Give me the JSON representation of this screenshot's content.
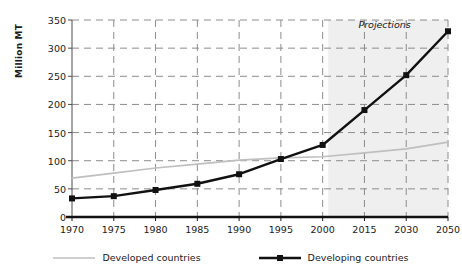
{
  "chart_data": {
    "type": "line",
    "title": "",
    "xlabel": "",
    "ylabel": "Million MT",
    "categories": [
      "1970",
      "1975",
      "1980",
      "1985",
      "1990",
      "1995",
      "2000",
      "2015",
      "2030",
      "2050"
    ],
    "ylim": [
      0,
      350
    ],
    "yticks": [
      0,
      50,
      100,
      150,
      200,
      250,
      300,
      350
    ],
    "ytick_labels": [
      "0",
      "50",
      "100",
      "150",
      "200",
      "250",
      "300",
      "350"
    ],
    "grid": true,
    "grid_style": "dashed",
    "legend_position": "bottom",
    "annotations": [
      {
        "text": "Projections",
        "x_category": "2015",
        "y": 340,
        "style": "italic"
      }
    ],
    "shaded_region": {
      "label": "Projections",
      "from_x": 2002,
      "to_x": "2050",
      "color": "#efefef"
    },
    "series": [
      {
        "name": "Developed countries",
        "color": "#bfbfbf",
        "marker": "none",
        "values": [
          69,
          78,
          87,
          94,
          101,
          105,
          107,
          114,
          121,
          133
        ]
      },
      {
        "name": "Developing countries",
        "color": "#111111",
        "marker": "square",
        "values": [
          33,
          37,
          48,
          59,
          76,
          103,
          128,
          190,
          252,
          330
        ]
      }
    ]
  },
  "legend": {
    "items": [
      {
        "label": "Developed countries",
        "color": "#bfbfbf",
        "marker": "none"
      },
      {
        "label": "Developing countries",
        "color": "#111111",
        "marker": "square"
      }
    ]
  }
}
